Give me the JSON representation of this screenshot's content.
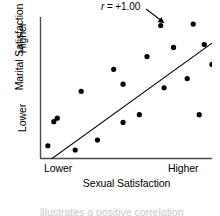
{
  "chart_data": {
    "type": "scatter",
    "title": "",
    "xlabel": "Sexual Satisfaction",
    "ylabel": "Marital Satisfaction",
    "xticklabels": [
      "Lower",
      "Higher"
    ],
    "yticklabels": [
      "Lower",
      "Higher"
    ],
    "xlim": [
      0,
      100
    ],
    "ylim": [
      0,
      100
    ],
    "grid": false,
    "legend": false,
    "annotations": [
      {
        "name": "correlation-label",
        "text_prefix": "r",
        "text_suffix": " = +1.00",
        "full_text": "r = +1.00",
        "points_to": [
          70.0,
          94.0
        ]
      }
    ],
    "marker": {
      "shape": "circle",
      "color": "#000000",
      "size": 5.2
    },
    "trendline": {
      "name": "regression-line",
      "color": "#000000",
      "x": [
        3.0,
        120.0
      ],
      "y": [
        -3.0,
        99.0
      ],
      "style": "solid"
    },
    "points": [
      {
        "x": 4.0,
        "y": 9.0
      },
      {
        "x": 20.0,
        "y": 6.0
      },
      {
        "x": 7.5,
        "y": 26.0
      },
      {
        "x": 9.5,
        "y": 28.5
      },
      {
        "x": 33.0,
        "y": 13.0
      },
      {
        "x": 48.0,
        "y": 25.5
      },
      {
        "x": 23.5,
        "y": 47.5
      },
      {
        "x": 57.5,
        "y": 31.0
      },
      {
        "x": 92.5,
        "y": 31.0
      },
      {
        "x": 48.0,
        "y": 52.5
      },
      {
        "x": 42.5,
        "y": 63.0
      },
      {
        "x": 72.0,
        "y": 50.0
      },
      {
        "x": 85.5,
        "y": 56.5
      },
      {
        "x": 62.0,
        "y": 72.0
      },
      {
        "x": 77.5,
        "y": 78.5
      },
      {
        "x": 100.0,
        "y": 66.5
      },
      {
        "x": 95.5,
        "y": 80.5
      },
      {
        "x": 70.0,
        "y": 94.0
      },
      {
        "x": 89.0,
        "y": 95.0
      }
    ]
  },
  "axes": {
    "y_title": "Marital Satisfaction",
    "y_tick_high": "Higher",
    "y_tick_low": "Lower",
    "x_title": "Sexual Satisfaction",
    "x_tick_low": "Lower",
    "x_tick_high": "Higher"
  },
  "caption_partial": "illustrates a positive correlation",
  "colors": {
    "axis": "#4d4d4d",
    "marker": "#000000",
    "line": "#000000",
    "text": "#000000",
    "background": "#ffffff"
  }
}
